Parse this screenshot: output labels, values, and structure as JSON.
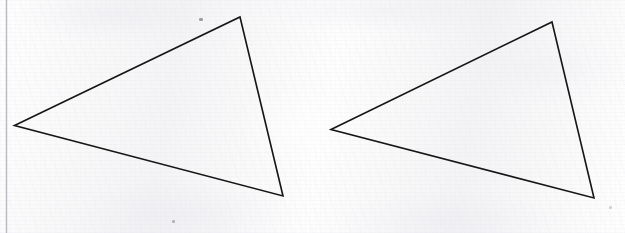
{
  "document": {
    "kind": "scanned-paper-sheet",
    "description": "Scanned sheet of lined notebook paper with two hand-drawn triangles",
    "width": 625,
    "height": 233,
    "background_color": "#f6f6f7",
    "ink_color": "#1a1a1a",
    "margin_line_color": "#b9b9bf"
  },
  "margin_line": {
    "label": "left margin rule",
    "x": 6.5,
    "y_start": 0,
    "y_end": 233,
    "color": "#b9b9bf",
    "width": 1.4
  },
  "figures": [
    {
      "name": "triangle-left",
      "label": "Triangle 1",
      "stroke_color": "#161616",
      "stroke_width": 1.6,
      "fill": "none",
      "vertices": [
        {
          "label": "A",
          "x": 14.5,
          "y": 125.5
        },
        {
          "label": "B",
          "x": 240.0,
          "y": 17.0
        },
        {
          "label": "C",
          "x": 283.0,
          "y": 196.0
        }
      ],
      "points_attr": "14.5,125.5 240,17 283,196"
    },
    {
      "name": "triangle-right",
      "label": "Triangle 2",
      "stroke_color": "#161616",
      "stroke_width": 1.6,
      "fill": "none",
      "vertices": [
        {
          "label": "A'",
          "x": 331.0,
          "y": 129.5
        },
        {
          "label": "B'",
          "x": 552.0,
          "y": 22.0
        },
        {
          "label": "C'",
          "x": 594.0,
          "y": 198.0
        }
      ],
      "points_attr": "331,129.5 552,22 594,198"
    }
  ],
  "specks": [
    {
      "name": "speck-1",
      "x": 172,
      "y": 220,
      "w": 3,
      "h": 3,
      "opacity": 0.55
    },
    {
      "name": "speck-2",
      "x": 199,
      "y": 18,
      "w": 4,
      "h": 3,
      "opacity": 0.75
    },
    {
      "name": "speck-3",
      "x": 609,
      "y": 206,
      "w": 3,
      "h": 3,
      "opacity": 0.35
    }
  ]
}
